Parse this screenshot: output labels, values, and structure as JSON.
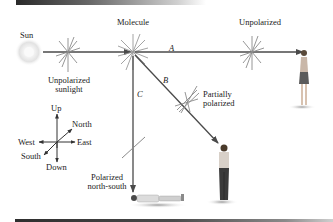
{
  "diagram": {
    "labels": {
      "sun": "Sun",
      "unpolarized_sunlight_line1": "Unpolarized",
      "unpolarized_sunlight_line2": "sunlight",
      "molecule": "Molecule",
      "unpolarized": "Unpolarized",
      "path_a": "A",
      "path_b": "B",
      "path_c": "C",
      "partially_polarized_line1": "Partially",
      "partially_polarized_line2": "polarized",
      "polarized_ns_line1": "Polarized",
      "polarized_ns_line2": "north-south"
    },
    "compass": {
      "up": "Up",
      "down": "Down",
      "north": "North",
      "south": "South",
      "east": "East",
      "west": "West"
    },
    "colors": {
      "ray": "#4a4a4a",
      "burst": "#8a8a8a",
      "sun_glow": "#e6e6e6"
    }
  }
}
